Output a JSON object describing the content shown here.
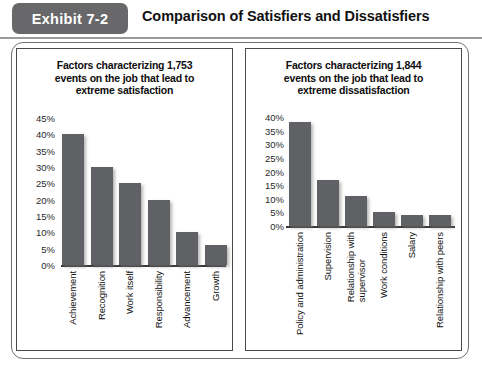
{
  "header": {
    "badge_label": "Exhibit 7-2",
    "title": "Comparison of Satisfiers and Dissatisfiers"
  },
  "panels": [
    {
      "id": "satisfiers",
      "title_line1": "Factors characterizing 1,753",
      "title_line2": "events on the job that lead to",
      "title_line3": "extreme satisfaction"
    },
    {
      "id": "dissatisfiers",
      "title_line1": "Factors characterizing 1,844",
      "title_line2": "events on the job that lead to",
      "title_line3": "extreme dissatisfaction"
    }
  ],
  "colors": {
    "bar_fill": "#5f6164",
    "badge_background": "#68686a",
    "frame_border": "#6e6e70",
    "axis_line": "#3a3a3c",
    "text": "#111111"
  },
  "chart_data": [
    {
      "type": "bar",
      "id": "satisfiers",
      "title": "Factors characterizing 1,753 events on the job that lead to extreme satisfaction",
      "xlabel": "",
      "ylabel": "",
      "ylim": [
        0,
        45
      ],
      "yticks": [
        45,
        40,
        35,
        30,
        25,
        20,
        15,
        10,
        5,
        0
      ],
      "ytick_labels": [
        "45%",
        "40%",
        "35%",
        "30%",
        "25%",
        "20%",
        "15%",
        "10%",
        "5%",
        "0%"
      ],
      "grid": false,
      "legend": "none",
      "categories": [
        "Achievement",
        "Recognition",
        "Work itself",
        "Responsibility",
        "Advancement",
        "Growth"
      ],
      "values": [
        40,
        30,
        25,
        20,
        10,
        6
      ]
    },
    {
      "type": "bar",
      "id": "dissatisfiers",
      "title": "Factors characterizing 1,844 events on the job that lead to extreme dissatisfaction",
      "xlabel": "",
      "ylabel": "",
      "ylim": [
        0,
        40
      ],
      "yticks": [
        40,
        35,
        30,
        25,
        20,
        15,
        10,
        5,
        0
      ],
      "ytick_labels": [
        "40%",
        "35%",
        "30%",
        "25%",
        "20%",
        "15%",
        "10%",
        "5%",
        "0%"
      ],
      "grid": false,
      "legend": "none",
      "categories": [
        "Policy and administration",
        "Supervision",
        "Relationship with supervisor",
        "Work conditions",
        "Salary",
        "Relationship with peers"
      ],
      "values": [
        38,
        17,
        11,
        5,
        4,
        4
      ]
    }
  ]
}
